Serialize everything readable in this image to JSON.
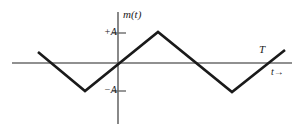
{
  "figure": {
    "title": "",
    "background_color": "#ffffff",
    "axis_color": "#6b6b6b",
    "waveform_color": "#1a1a1a",
    "text_color": "#1a1a1a"
  },
  "labels": {
    "signal": "m(t)",
    "amplitude_positive": "+A",
    "amplitude_negative": "−A",
    "period": "T",
    "time_axis": "t→"
  },
  "chart_data": {
    "type": "line",
    "title": "",
    "xlabel": "t→",
    "ylabel": "m(t)",
    "grid": false,
    "legend": false,
    "annotations": [
      "m(t)",
      "+A",
      "−A",
      "T",
      "t→"
    ],
    "yticks": [
      {
        "value": 1,
        "label": "+A"
      },
      {
        "value": -1,
        "label": "−A"
      }
    ],
    "xticks": [],
    "ylim": [
      -1.75,
      1.75
    ],
    "xlim": [
      -1.9,
      3.15
    ],
    "axes": {
      "x_axis_pixel_y": 63,
      "y_axis_pixel_x": 118,
      "x_axis_pixel_start": 12,
      "x_axis_pixel_end": 292,
      "y_axis_pixel_top": 12,
      "y_axis_pixel_bottom": 124
    },
    "series": [
      {
        "name": "m(t)",
        "points_pixel": [
          [
            38,
            52
          ],
          [
            85,
            91
          ],
          [
            158,
            32
          ],
          [
            232,
            92
          ],
          [
            285,
            50
          ]
        ],
        "points_data": [
          [
            -1.35,
            0.38
          ],
          [
            -0.56,
            -0.97
          ],
          [
            0.68,
            1.07
          ],
          [
            1.93,
            -1.0
          ],
          [
            2.82,
            0.45
          ]
        ]
      }
    ]
  }
}
